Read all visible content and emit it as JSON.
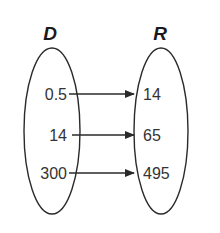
{
  "diagram": {
    "type": "mapping",
    "domain_label": "D",
    "range_label": "R",
    "domain_values": [
      "0.5",
      "14",
      "300"
    ],
    "range_values": [
      "14",
      "65",
      "495"
    ],
    "mappings": [
      {
        "from": "0.5",
        "to": "14"
      },
      {
        "from": "14",
        "to": "65"
      },
      {
        "from": "300",
        "to": "495"
      }
    ],
    "colors": {
      "stroke": "#2a2a2a",
      "text": "#333333",
      "background": "#ffffff"
    }
  }
}
